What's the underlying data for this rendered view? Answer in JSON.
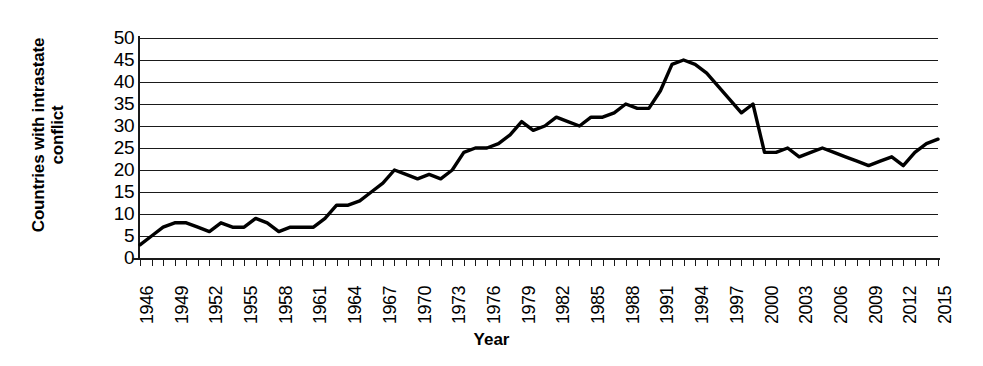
{
  "chart_data": {
    "type": "line",
    "title": "",
    "xlabel": "Year",
    "ylabel": "Countries with intrastate conflict",
    "ylabel_line1": "Countries with intrastate",
    "ylabel_line2": "conflict",
    "ylim": [
      0,
      50
    ],
    "ytick_step": 5,
    "yticks": [
      50,
      45,
      40,
      35,
      30,
      25,
      20,
      15,
      10,
      5,
      0
    ],
    "xlim": [
      1946,
      2015
    ],
    "xtick_labels": [
      "1946",
      "1949",
      "1952",
      "1955",
      "1958",
      "1961",
      "1964",
      "1967",
      "1970",
      "1973",
      "1976",
      "1979",
      "1982",
      "1985",
      "1988",
      "1991",
      "1994",
      "1997",
      "2000",
      "2003",
      "2006",
      "2009",
      "2012",
      "2015"
    ],
    "xtick_label_step": 3,
    "minor_ticks_every": 1,
    "grid": "horizontal",
    "legend": "none",
    "line_color": "#000000",
    "grid_color": "#1a1a1a",
    "background_color": "#ffffff",
    "x": [
      1946,
      1947,
      1948,
      1949,
      1950,
      1951,
      1952,
      1953,
      1954,
      1955,
      1956,
      1957,
      1958,
      1959,
      1960,
      1961,
      1962,
      1963,
      1964,
      1965,
      1966,
      1967,
      1968,
      1969,
      1970,
      1971,
      1972,
      1973,
      1974,
      1975,
      1976,
      1977,
      1978,
      1979,
      1980,
      1981,
      1982,
      1983,
      1984,
      1985,
      1986,
      1987,
      1988,
      1989,
      1990,
      1991,
      1992,
      1993,
      1994,
      1995,
      1996,
      1997,
      1998,
      1999,
      2000,
      2001,
      2002,
      2003,
      2004,
      2005,
      2006,
      2007,
      2008,
      2009,
      2010,
      2011,
      2012,
      2013,
      2014,
      2015
    ],
    "values": [
      3,
      5,
      7,
      8,
      8,
      7,
      6,
      8,
      7,
      7,
      9,
      8,
      6,
      7,
      7,
      7,
      9,
      12,
      12,
      13,
      15,
      17,
      20,
      19,
      18,
      19,
      18,
      20,
      24,
      25,
      25,
      26,
      28,
      31,
      29,
      30,
      32,
      31,
      30,
      32,
      32,
      33,
      35,
      34,
      34,
      38,
      44,
      45,
      44,
      42,
      39,
      36,
      33,
      35,
      24,
      24,
      25,
      23,
      24,
      25,
      24,
      23,
      22,
      21,
      22,
      23,
      21,
      24,
      26,
      27
    ]
  }
}
